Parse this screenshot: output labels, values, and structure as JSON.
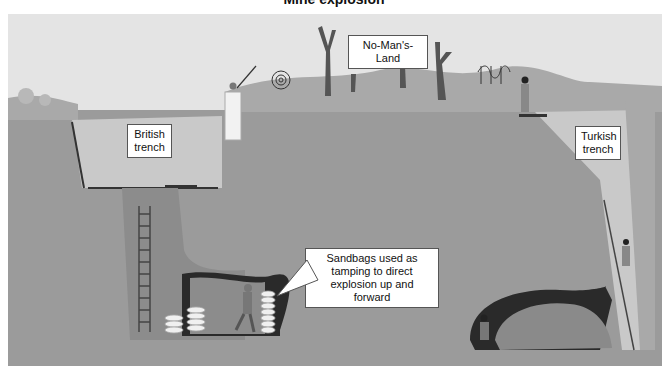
{
  "title": "Mine explosion",
  "labels": {
    "no_mans_land": "No-Man's-Land",
    "british_trench": "British trench",
    "turkish_trench": "Turkish trench",
    "sandbags_callout": "Sandbags used as tamping to direct explosion up and forward"
  },
  "colors": {
    "sky": "#e4e4e4",
    "surface": "#a9a9a9",
    "earth": "#9b9b9b",
    "trench_fill": "#c9c9c9",
    "shaft": "#8c8c8c",
    "tunnel_dark": "#2a2a2a",
    "rubble": "#8a8a8a"
  }
}
